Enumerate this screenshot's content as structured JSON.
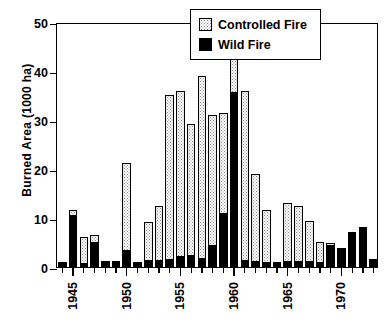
{
  "chart_data": {
    "type": "bar",
    "stacked": true,
    "title": "",
    "xlabel": "",
    "ylabel": "Burned Area (1000 ha)",
    "ylim": [
      0,
      50
    ],
    "yticks": [
      0,
      10,
      20,
      30,
      40,
      50
    ],
    "ytick_labels": [
      "0",
      "10",
      "20",
      "30",
      "40",
      "50"
    ],
    "xtick_labels": [
      "1945",
      "1950",
      "1955",
      "1960",
      "1965",
      "1970"
    ],
    "xtick_years": [
      1945,
      1950,
      1955,
      1960,
      1965,
      1970
    ],
    "grid": false,
    "legend_position": "top-right",
    "legend": [
      "Controlled Fire",
      "Wild Fire"
    ],
    "colors": {
      "controlled_fire": "#fdfdfd",
      "wild_fire": "#000000",
      "axis": "#000000"
    },
    "categories": [
      1944,
      1945,
      1946,
      1947,
      1948,
      1949,
      1950,
      1951,
      1952,
      1953,
      1954,
      1955,
      1956,
      1957,
      1958,
      1959,
      1960,
      1961,
      1962,
      1963,
      1964,
      1965,
      1966,
      1967,
      1968,
      1969,
      1970,
      1971,
      1972,
      1973
    ],
    "series": [
      {
        "name": "Wild Fire",
        "values": [
          1.0,
          10.5,
          0.7,
          5.0,
          1.3,
          1.2,
          3.2,
          1.1,
          1.2,
          1.3,
          1.4,
          2.1,
          2.2,
          1.6,
          4.3,
          10.8,
          35.5,
          1.2,
          1.1,
          0.9,
          1.0,
          1.1,
          1.0,
          1.0,
          0.9,
          4.3,
          3.5,
          6.7,
          8.2,
          1.6
        ]
      },
      {
        "name": "Controlled Fire",
        "values": [
          0.0,
          1.2,
          5.5,
          1.5,
          0.0,
          0.0,
          18.0,
          0.0,
          8.0,
          11.1,
          33.8,
          33.9,
          27.0,
          37.4,
          26.8,
          20.6,
          10.0,
          34.8,
          17.8,
          10.7,
          0.0,
          12.0,
          11.4,
          8.4,
          4.3,
          0.6,
          0.3,
          0.5,
          0.0,
          0.0
        ]
      }
    ],
    "totals": [
      1.0,
      11.7,
      6.2,
      6.5,
      1.3,
      1.2,
      21.2,
      1.1,
      9.2,
      12.4,
      35.2,
      36.0,
      29.2,
      39.0,
      31.1,
      31.4,
      45.5,
      36.0,
      18.9,
      11.6,
      1.0,
      13.1,
      12.4,
      9.4,
      5.2,
      4.9,
      3.8,
      7.2,
      8.2,
      1.6
    ]
  }
}
